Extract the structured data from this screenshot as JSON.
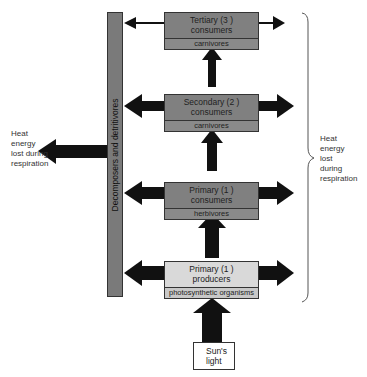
{
  "decomposers": {
    "label": "Decomposers and detritivores"
  },
  "levels": [
    {
      "title_line1": "Tertiary (3 )",
      "title_line2": "consumers",
      "sub": "carnivores"
    },
    {
      "title_line1": "Secondary (2 )",
      "title_line2": "consumers",
      "sub": "carnivores"
    },
    {
      "title_line1": "Primary (1 )",
      "title_line2": "consumers",
      "sub": "herbivores"
    },
    {
      "title_line1": "Primary (1 )",
      "title_line2": "producers",
      "sub": "photosynthetic organisms"
    }
  ],
  "sun": {
    "line1": "Sun's",
    "line2": "light"
  },
  "heat_left": {
    "line1": "Heat",
    "line2": "energy",
    "line3": "lost during",
    "line4": "respiration"
  },
  "heat_right": {
    "line1": "Heat",
    "line2": "energy",
    "line3": "lost",
    "line4": "during",
    "line5": "respiration"
  },
  "colors": {
    "consumer_box": "#808080",
    "producer_box": "#d9d9d9",
    "decomposer_bar": "#7a7a7a",
    "arrow": "#111111"
  }
}
